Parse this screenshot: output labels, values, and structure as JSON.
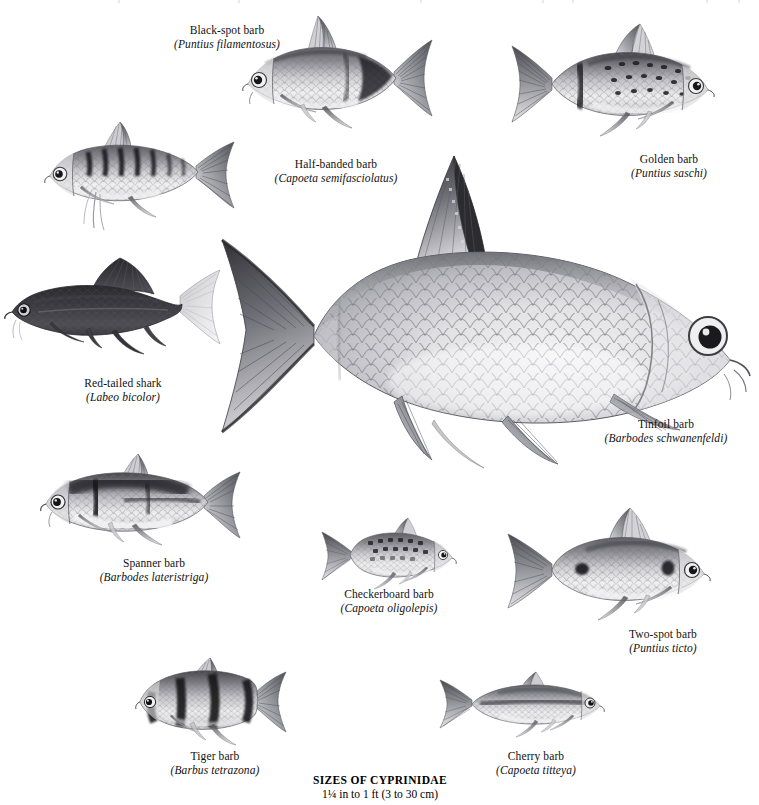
{
  "plate": {
    "width": 759,
    "height": 805,
    "background": "#ffffff",
    "ink": "#111111",
    "caption": {
      "title": "SIZES OF CYPRINIDAE",
      "subtitle": "1¼ in to 1 ft (3 to 30 cm)"
    }
  },
  "species": [
    {
      "id": "black-spot-barb",
      "common": "Black-spot barb",
      "scientific": "(Puntius filamentosus)",
      "label_x": 152,
      "label_y": 24,
      "label_w": 150
    },
    {
      "id": "golden-barb",
      "common": "Golden barb",
      "scientific": "(Puntius saschi)",
      "label_x": 604,
      "label_y": 153,
      "label_w": 130
    },
    {
      "id": "half-banded-barb",
      "common": "Half-banded barb",
      "scientific": "(Capoeta semifasciolatus)",
      "label_x": 258,
      "label_y": 158,
      "label_w": 156
    },
    {
      "id": "red-tailed-shark",
      "common": "Red-tailed shark",
      "scientific": "(Labeo bicolor)",
      "label_x": 57,
      "label_y": 377,
      "label_w": 132
    },
    {
      "id": "tinfoil-barb",
      "common": "Tinfoil barb",
      "scientific": "(Barbodes schwanenfeldi)",
      "label_x": 586,
      "label_y": 418,
      "label_w": 160
    },
    {
      "id": "spanner-barb",
      "common": "Spanner barb",
      "scientific": "(Barbodes lateristriga)",
      "label_x": 80,
      "label_y": 557,
      "label_w": 148
    },
    {
      "id": "checkerboard-barb",
      "common": "Checkerboard barb",
      "scientific": "(Capoeta oligolepis)",
      "label_x": 318,
      "label_y": 588,
      "label_w": 142
    },
    {
      "id": "two-spot-barb",
      "common": "Two-spot barb",
      "scientific": "(Puntius ticto)",
      "label_x": 600,
      "label_y": 628,
      "label_w": 126
    },
    {
      "id": "tiger-barb",
      "common": "Tiger barb",
      "scientific": "(Barbus tetrazona)",
      "label_x": 148,
      "label_y": 750,
      "label_w": 134
    },
    {
      "id": "cherry-barb",
      "common": "Cherry barb",
      "scientific": "(Capoeta titteya)",
      "label_x": 472,
      "label_y": 750,
      "label_w": 128
    }
  ],
  "figures": {
    "black_spot_barb": {
      "x": 226,
      "y": 12,
      "w": 216,
      "h": 130,
      "facing": "left",
      "tone": "silver-dark-caudal-bar"
    },
    "golden_barb": {
      "x": 496,
      "y": 20,
      "w": 234,
      "h": 130,
      "facing": "right",
      "tone": "silver-spotted"
    },
    "half_banded_barb": {
      "x": 38,
      "y": 120,
      "w": 212,
      "h": 110,
      "facing": "left",
      "tone": "silver-barred"
    },
    "red_tailed_shark": {
      "x": 6,
      "y": 252,
      "w": 212,
      "h": 112,
      "facing": "left",
      "tone": "near-black-body-pale-tail"
    },
    "tinfoil_barb": {
      "x": 222,
      "y": 150,
      "w": 536,
      "h": 342,
      "facing": "right",
      "tone": "large-silver-scaled"
    },
    "spanner_barb": {
      "x": 30,
      "y": 452,
      "w": 224,
      "h": 110,
      "facing": "left",
      "tone": "silver-dark-dorsum"
    },
    "checkerboard_barb": {
      "x": 316,
      "y": 516,
      "w": 148,
      "h": 82,
      "facing": "right",
      "tone": "small-silver"
    },
    "two_spot_barb": {
      "x": 492,
      "y": 504,
      "w": 234,
      "h": 122,
      "facing": "right",
      "tone": "silver-two-spot"
    },
    "tiger_barb": {
      "x": 124,
      "y": 656,
      "w": 172,
      "h": 92,
      "facing": "left",
      "tone": "banded-dark"
    },
    "cherry_barb": {
      "x": 430,
      "y": 668,
      "w": 184,
      "h": 80,
      "facing": "right",
      "tone": "slender-silver"
    }
  }
}
